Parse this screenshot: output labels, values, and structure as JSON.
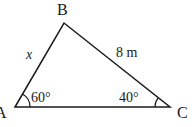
{
  "figure": {
    "vertices": {
      "A": {
        "label": "A"
      },
      "B": {
        "label": "B"
      },
      "C": {
        "label": "C"
      }
    },
    "sides": {
      "AB": {
        "label": "x"
      },
      "BC": {
        "label": "8 m"
      }
    },
    "angles": {
      "A": {
        "label": "60°"
      },
      "C": {
        "label": "40°"
      }
    },
    "line_color": "#1a1a1a"
  }
}
